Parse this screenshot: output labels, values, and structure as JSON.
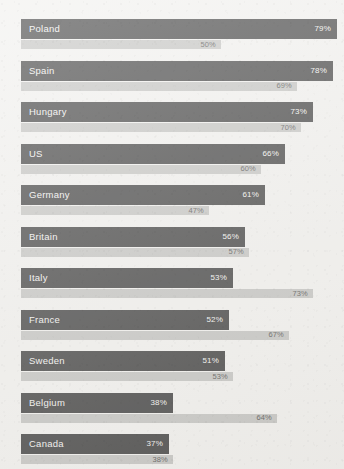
{
  "chart_data": {
    "type": "bar",
    "title": "",
    "subtitle": "",
    "xlabel": "",
    "ylabel": "",
    "xlim": [
      0,
      100
    ],
    "grid": false,
    "legend_position": "none",
    "orientation": "horizontal",
    "value_suffix": "%",
    "categories": [
      "Poland",
      "Spain",
      "Hungary",
      "US",
      "Germany",
      "Britain",
      "Italy",
      "France",
      "Sweden",
      "Belgium",
      "Canada"
    ],
    "series": [
      {
        "name": "Primary",
        "color": "#1b1b1b",
        "label_color": "#f2f1ef",
        "values": [
          79,
          78,
          73,
          66,
          61,
          56,
          53,
          52,
          51,
          38,
          37
        ],
        "value_labels": [
          "79%",
          "78%",
          "73%",
          "66%",
          "61%",
          "56%",
          "53%",
          "52%",
          "51%",
          "38%",
          "37%"
        ]
      },
      {
        "name": "Secondary",
        "color": "#b8b8b5",
        "label_color": "#33322f",
        "values": [
          50,
          69,
          70,
          60,
          47,
          57,
          73,
          67,
          53,
          64,
          38
        ],
        "value_labels": [
          "50%",
          "69%",
          "70%",
          "60%",
          "47%",
          "57%",
          "73%",
          "67%",
          "53%",
          "64%",
          "38%"
        ]
      }
    ],
    "rows": [
      {
        "category": "Poland",
        "primary": 79,
        "primary_label": "79%",
        "secondary": 50,
        "secondary_label": "50%"
      },
      {
        "category": "Spain",
        "primary": 78,
        "primary_label": "78%",
        "secondary": 69,
        "secondary_label": "69%"
      },
      {
        "category": "Hungary",
        "primary": 73,
        "primary_label": "73%",
        "secondary": 70,
        "secondary_label": "70%"
      },
      {
        "category": "US",
        "primary": 66,
        "primary_label": "66%",
        "secondary": 60,
        "secondary_label": "60%"
      },
      {
        "category": "Germany",
        "primary": 61,
        "primary_label": "61%",
        "secondary": 47,
        "secondary_label": "47%"
      },
      {
        "category": "Britain",
        "primary": 56,
        "primary_label": "56%",
        "secondary": 57,
        "secondary_label": "57%"
      },
      {
        "category": "Italy",
        "primary": 53,
        "primary_label": "53%",
        "secondary": 73,
        "secondary_label": "73%"
      },
      {
        "category": "France",
        "primary": 52,
        "primary_label": "52%",
        "secondary": 67,
        "secondary_label": "67%"
      },
      {
        "category": "Sweden",
        "primary": 51,
        "primary_label": "51%",
        "secondary": 53,
        "secondary_label": "53%"
      },
      {
        "category": "Belgium",
        "primary": 38,
        "primary_label": "38%",
        "secondary": 64,
        "secondary_label": "64%"
      },
      {
        "category": "Canada",
        "primary": 37,
        "primary_label": "37%",
        "secondary": 38,
        "secondary_label": "38%"
      }
    ]
  },
  "layout": {
    "plot_left": 21,
    "plot_top": 19,
    "row_pitch": 41.5,
    "full_scale_px": 400,
    "background_color": "#efeeeb"
  }
}
